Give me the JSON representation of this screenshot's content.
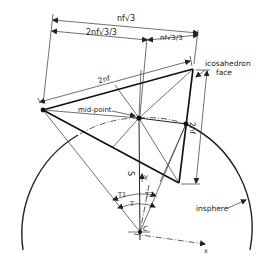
{
  "diagram": {
    "dimensions": {
      "top_total": "nf√3",
      "top_left": "2nf√3/3",
      "top_right": "nf√3/3",
      "edge_top": "2nf",
      "edge_right": "2nf"
    },
    "labels": {
      "icosahedron_face_line1": "icosahedron",
      "icosahedron_face_line2": "face",
      "mid_point": "mid-point",
      "insphere": "insphere",
      "radius": "S",
      "y_axis": "Y",
      "x_axis": "x",
      "center": "C",
      "angle_t1": "T1",
      "angle_t2": "T2",
      "angle_t": "T"
    },
    "colors": {
      "ink": "#222222",
      "paper": "#ffffff"
    }
  }
}
